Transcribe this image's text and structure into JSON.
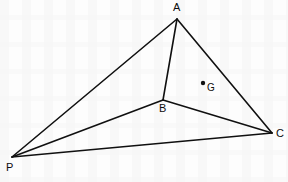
{
  "figure": {
    "type": "geometry-diagram",
    "background_color": "#fdfdfd",
    "stroke_color": "#101010",
    "stroke_width": 1.6,
    "label_color": "#0d0d0d",
    "canvas": {
      "width": 288,
      "height": 182
    },
    "points": [
      {
        "id": "A",
        "label": "A",
        "x": 177,
        "y": 19,
        "label_x": 173,
        "label_y": 2,
        "marker": "none"
      },
      {
        "id": "B",
        "label": "B",
        "x": 163,
        "y": 100,
        "label_x": 159,
        "label_y": 103,
        "marker": "none"
      },
      {
        "id": "C",
        "label": "C",
        "x": 272,
        "y": 133,
        "label_x": 276,
        "label_y": 128,
        "marker": "none"
      },
      {
        "id": "P",
        "label": "P",
        "x": 12,
        "y": 157,
        "label_x": 6,
        "label_y": 162,
        "marker": "none"
      },
      {
        "id": "G",
        "label": "G",
        "x": 203,
        "y": 83,
        "label_x": 207,
        "label_y": 82,
        "marker": "dot",
        "marker_radius": 2.2
      }
    ],
    "segments": [
      {
        "id": "AP",
        "from": "A",
        "to": "P",
        "x1": 177,
        "y1": 19,
        "x2": 12,
        "y2": 157
      },
      {
        "id": "AB",
        "from": "A",
        "to": "B",
        "x1": 177,
        "y1": 19,
        "x2": 163,
        "y2": 100
      },
      {
        "id": "AC",
        "from": "A",
        "to": "C",
        "x1": 177,
        "y1": 19,
        "x2": 272,
        "y2": 133
      },
      {
        "id": "BP",
        "from": "B",
        "to": "P",
        "x1": 163,
        "y1": 100,
        "x2": 12,
        "y2": 157
      },
      {
        "id": "BC",
        "from": "B",
        "to": "C",
        "x1": 163,
        "y1": 100,
        "x2": 272,
        "y2": 133
      },
      {
        "id": "PC",
        "from": "P",
        "to": "C",
        "x1": 12,
        "y1": 157,
        "x2": 272,
        "y2": 133
      }
    ]
  }
}
